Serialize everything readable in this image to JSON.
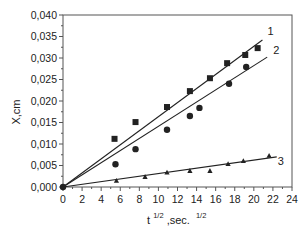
{
  "chart_data": {
    "type": "scatter",
    "title": "",
    "xlabel": "t^1/2, sec.^1/2",
    "xlabel_parts": {
      "base": "t",
      "sup1": "1/2",
      "mid": ",sec.",
      "sup2": "1/2"
    },
    "ylabel": "X,cm",
    "xlim": [
      0,
      24
    ],
    "ylim": [
      0,
      0.04
    ],
    "x_ticks": [
      0,
      2,
      4,
      6,
      8,
      10,
      12,
      14,
      16,
      18,
      20,
      22,
      24
    ],
    "y_ticks": [
      0.0,
      0.005,
      0.01,
      0.015,
      0.02,
      0.025,
      0.03,
      0.035,
      0.04
    ],
    "y_tick_labels": [
      "0,000",
      "0,005",
      "0,010",
      "0,015",
      "0,020",
      "0,025",
      "0,030",
      "0,035",
      "0,040"
    ],
    "grid": false,
    "legend": "inline labels at line ends",
    "series": [
      {
        "name": "1",
        "marker": "square",
        "x": [
          5.4,
          7.6,
          10.9,
          13.3,
          15.4,
          17.2,
          19.1,
          20.4
        ],
        "y": [
          0.0112,
          0.0151,
          0.0186,
          0.0223,
          0.0253,
          0.0288,
          0.0307,
          0.0323
        ],
        "fit_line": {
          "x": [
            0,
            20.9
          ],
          "y": [
            0,
            0.0342
          ]
        }
      },
      {
        "name": "2",
        "marker": "circle",
        "x": [
          5.5,
          7.6,
          10.9,
          13.3,
          14.3,
          17.4,
          19.2
        ],
        "y": [
          0.0053,
          0.0088,
          0.0133,
          0.0165,
          0.0184,
          0.024,
          0.0279
        ],
        "fit_line": {
          "x": [
            0,
            21.4
          ],
          "y": [
            0,
            0.0302
          ]
        }
      },
      {
        "name": "3",
        "marker": "triangle",
        "x": [
          5.6,
          8.6,
          10.9,
          13.3,
          15.4,
          17.3,
          18.9,
          21.6
        ],
        "y": [
          0.0014,
          0.0023,
          0.0033,
          0.0037,
          0.0037,
          0.0053,
          0.006,
          0.0072
        ],
        "fit_line": {
          "x": [
            0,
            22.4
          ],
          "y": [
            0,
            0.007
          ]
        }
      }
    ]
  }
}
